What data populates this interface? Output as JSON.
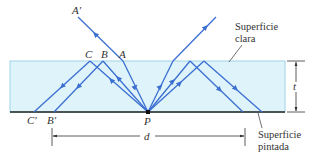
{
  "labels": {
    "A_prime": "A′",
    "A": "A",
    "B": "B",
    "C": "C",
    "B_prime": "B′",
    "C_prime": "C′",
    "P": "P",
    "d": "d",
    "t": "t"
  },
  "annotations": {
    "clear_surface_line1": "Superficie",
    "clear_surface_line2": "clara",
    "painted_surface_line1": "Superficie",
    "painted_surface_line2": "pintada"
  },
  "colors": {
    "glass": "#dff3fa",
    "glass_edge": "#9fd3e6",
    "ray": "#3b6fd1",
    "surface": "#222222"
  }
}
